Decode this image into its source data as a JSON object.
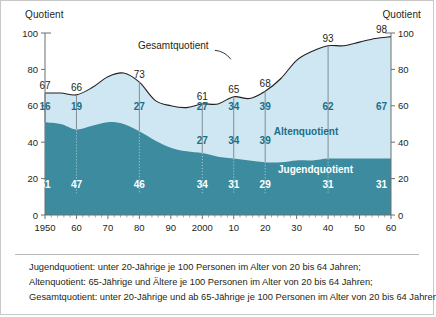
{
  "figure": {
    "axis_label_left": "Quotient",
    "axis_label_right": "Quotient"
  },
  "footnotes": [
    "Jugendquotient: unter 20-Jährige je 100 Personen im Alter von 20 bis 64 Jahren;",
    "Altenquotient: 65-Jährige und Ältere je 100 Personen im Alter von 20 bis 64 Jahren;",
    "Gesamtquotient: unter 20-Jährige und ab 65-Jährige je 100 Personen im Alter von 20 bis 64 Jahren."
  ],
  "colors": {
    "young_fill": "#3d8b9e",
    "old_fill": "#cfe7f2",
    "total_line": "#231f20",
    "axis": "#6d6e71",
    "label_old": "#1d6e85",
    "label_young": "#ffffff",
    "frame": "#c8c8c8"
  },
  "chart_data": {
    "type": "area",
    "title": "",
    "xlabel": "",
    "ylabel": "Quotient",
    "ylim": [
      0,
      100
    ],
    "xlim": [
      1950,
      2060
    ],
    "yticks": [
      0,
      20,
      40,
      60,
      80,
      100
    ],
    "ytick_labels": [
      "0",
      "20",
      "40",
      "60",
      "80",
      "100"
    ],
    "xticks": [
      1950,
      1960,
      1970,
      1980,
      1990,
      2000,
      2010,
      2020,
      2030,
      2040,
      2050,
      2060
    ],
    "xtick_labels": [
      "1950",
      "60",
      "70",
      "80",
      "90",
      "2000",
      "10",
      "20",
      "30",
      "40",
      "50",
      "60"
    ],
    "grid": false,
    "legend": "inline-annotations",
    "stacked": true,
    "annotations": [
      {
        "text": "Gesamtquotient",
        "x": 2002,
        "y": 91
      },
      {
        "text": "Altenquotient",
        "x": 2033,
        "y": 44
      },
      {
        "text": "Jugendquotient",
        "x": 2036,
        "y": 23
      }
    ],
    "labelled_points": [
      {
        "year": 1950,
        "total": 67,
        "alten": 16,
        "jugend": 51
      },
      {
        "year": 1960,
        "total": 66,
        "alten": 19,
        "jugend": 47
      },
      {
        "year": 1980,
        "total": 73,
        "alten": 27,
        "jugend": 46
      },
      {
        "year": 2000,
        "total": 61,
        "alten": 27,
        "jugend": 34
      },
      {
        "year": 2010,
        "total": 65,
        "alten": 34,
        "jugend": 31
      },
      {
        "year": 2020,
        "total": 68,
        "alten": 39,
        "jugend": 29
      },
      {
        "year": 2040,
        "total": 93,
        "alten": 62,
        "jugend": 31
      },
      {
        "year": 2060,
        "total": 98,
        "alten": 67,
        "jugend": 31
      }
    ],
    "series": [
      {
        "name": "Jugendquotient",
        "x": [
          1950,
          1955,
          1960,
          1965,
          1970,
          1975,
          1980,
          1985,
          1990,
          1995,
          2000,
          2005,
          2010,
          2015,
          2020,
          2025,
          2030,
          2035,
          2040,
          2045,
          2050,
          2055,
          2060
        ],
        "values": [
          51,
          50,
          47,
          49,
          51,
          50,
          46,
          41,
          37,
          35,
          34,
          32,
          31,
          30,
          29,
          29,
          30,
          30,
          31,
          31,
          31,
          31,
          31
        ]
      },
      {
        "name": "Altenquotient",
        "x": [
          1950,
          1955,
          1960,
          1965,
          1970,
          1975,
          1980,
          1985,
          1990,
          1995,
          2000,
          2005,
          2010,
          2015,
          2020,
          2025,
          2030,
          2035,
          2040,
          2045,
          2050,
          2055,
          2060
        ],
        "values": [
          16,
          17,
          19,
          21,
          25,
          28,
          27,
          22,
          23,
          24,
          27,
          29,
          34,
          34,
          39,
          46,
          55,
          60,
          62,
          62,
          64,
          66,
          67
        ]
      },
      {
        "name": "Gesamtquotient",
        "x": [
          1950,
          1955,
          1960,
          1965,
          1970,
          1975,
          1980,
          1985,
          1990,
          1995,
          2000,
          2005,
          2010,
          2015,
          2020,
          2025,
          2030,
          2035,
          2040,
          2045,
          2050,
          2055,
          2060
        ],
        "values": [
          67,
          67,
          66,
          70,
          76,
          78,
          73,
          63,
          60,
          59,
          61,
          61,
          65,
          64,
          68,
          75,
          85,
          90,
          93,
          93,
          95,
          97,
          98
        ]
      }
    ]
  }
}
